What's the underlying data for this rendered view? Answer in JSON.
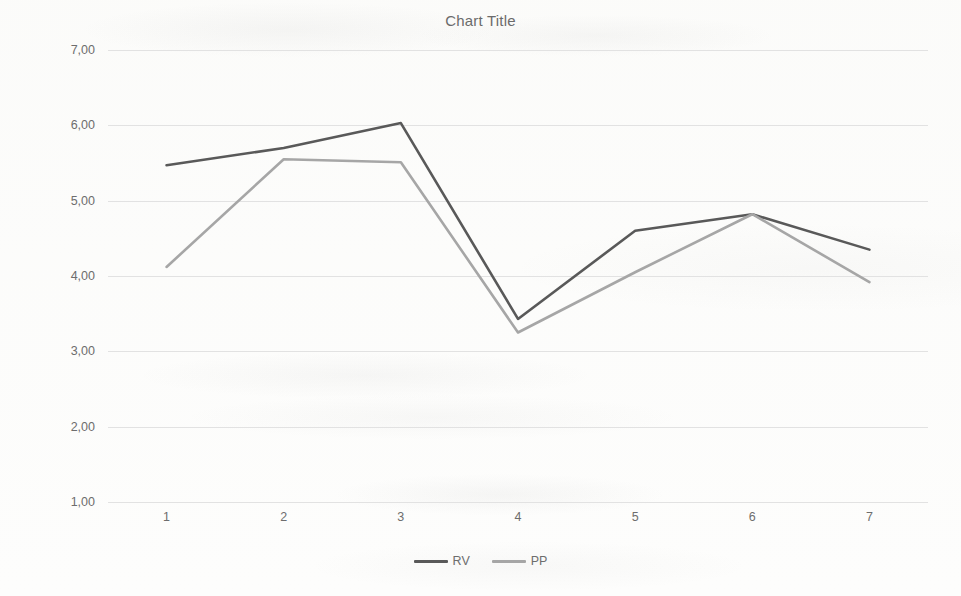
{
  "chart_data": {
    "type": "line",
    "title": "Chart Title",
    "xlabel": "",
    "ylabel": "",
    "categories": [
      "1",
      "2",
      "3",
      "4",
      "5",
      "6",
      "7"
    ],
    "x": [
      1,
      2,
      3,
      4,
      5,
      6,
      7
    ],
    "ylim": [
      1.0,
      7.0
    ],
    "ytick_labels": [
      "7,00",
      "6,00",
      "5,00",
      "4,00",
      "3,00",
      "2,00",
      "1,00"
    ],
    "ytick_values": [
      7.0,
      6.0,
      5.0,
      4.0,
      3.0,
      2.0,
      1.0
    ],
    "grid": true,
    "legend_position": "bottom",
    "series": [
      {
        "name": "RV",
        "color": "#595959",
        "values": [
          5.47,
          5.7,
          6.03,
          3.43,
          4.6,
          4.82,
          4.35
        ]
      },
      {
        "name": "PP",
        "color": "#a6a6a6",
        "values": [
          4.12,
          5.55,
          5.51,
          3.25,
          4.05,
          4.82,
          3.92
        ]
      }
    ]
  }
}
